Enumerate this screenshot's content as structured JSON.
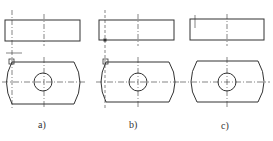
{
  "figure": {
    "panels": [
      {
        "label": "a)",
        "description": "Top view rectangle and front view rounded plate with hole; auxiliary line and small box at left corner"
      },
      {
        "label": "b)",
        "description": "Same views with projection line from top-left corner, marker at intersection"
      },
      {
        "label": "c)",
        "description": "Completed views with short vertical tick at top-left of rectangle"
      }
    ]
  },
  "colors": {
    "line": "#333333",
    "background": "#ffffff"
  }
}
